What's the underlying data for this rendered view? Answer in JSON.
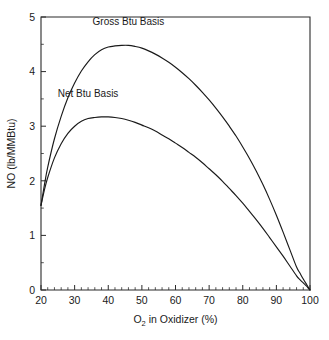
{
  "chart_data": {
    "type": "line",
    "title": "",
    "xlabel": "O2 in Oxidizer (%)",
    "xlabel_main": "O",
    "xlabel_sub": "2",
    "xlabel_rest": " in Oxidizer (%)",
    "ylabel": "NO (lb/MMBtu)",
    "xlim": [
      20,
      100
    ],
    "ylim": [
      0,
      5
    ],
    "x_ticks": [
      20,
      30,
      40,
      50,
      60,
      70,
      80,
      90,
      100
    ],
    "y_ticks": [
      0,
      1,
      2,
      3,
      4,
      5
    ],
    "x_minor_step": 2,
    "y_minor_step": 0.5,
    "grid": false,
    "legend_position": "inline-annotations",
    "series": [
      {
        "name": "Gross Btu Basis",
        "label_x": 46,
        "label_y": 4.85,
        "peak_x": 46,
        "peak_y": 4.48,
        "x": [
          20,
          21,
          22,
          24,
          26,
          28,
          30,
          32,
          34,
          36,
          38,
          40,
          42,
          44,
          46,
          48,
          50,
          52,
          54,
          56,
          58,
          60,
          62,
          64,
          66,
          68,
          70,
          72,
          74,
          76,
          78,
          80,
          82,
          84,
          86,
          88,
          90,
          92,
          94,
          96,
          97,
          98,
          99,
          99.5,
          100
        ],
        "y": [
          1.55,
          1.92,
          2.25,
          2.77,
          3.18,
          3.52,
          3.79,
          4.01,
          4.18,
          4.31,
          4.4,
          4.45,
          4.47,
          4.48,
          4.48,
          4.46,
          4.43,
          4.38,
          4.32,
          4.25,
          4.17,
          4.08,
          3.98,
          3.87,
          3.75,
          3.62,
          3.48,
          3.33,
          3.17,
          3.0,
          2.82,
          2.62,
          2.41,
          2.18,
          1.93,
          1.66,
          1.37,
          1.06,
          0.74,
          0.42,
          0.31,
          0.2,
          0.1,
          0.05,
          0.0
        ]
      },
      {
        "name": "Net Btu Basis",
        "label_x": 34,
        "label_y": 3.53,
        "peak_x": 41,
        "peak_y": 3.17,
        "x": [
          20,
          21,
          22,
          24,
          26,
          28,
          30,
          32,
          34,
          36,
          38,
          40,
          42,
          44,
          46,
          48,
          50,
          52,
          54,
          56,
          58,
          60,
          62,
          64,
          66,
          68,
          70,
          72,
          74,
          76,
          78,
          80,
          82,
          84,
          86,
          88,
          90,
          92,
          94,
          96,
          97,
          98,
          99,
          99.5,
          100
        ],
        "y": [
          1.55,
          1.83,
          2.06,
          2.42,
          2.68,
          2.87,
          3.0,
          3.09,
          3.14,
          3.16,
          3.17,
          3.17,
          3.16,
          3.14,
          3.11,
          3.07,
          3.02,
          2.97,
          2.91,
          2.84,
          2.77,
          2.69,
          2.61,
          2.52,
          2.43,
          2.33,
          2.22,
          2.11,
          1.99,
          1.86,
          1.73,
          1.59,
          1.44,
          1.29,
          1.13,
          0.96,
          0.79,
          0.62,
          0.44,
          0.26,
          0.19,
          0.13,
          0.07,
          0.03,
          0.0
        ]
      }
    ]
  },
  "colors": {
    "curve": "#1a1a1a",
    "axis": "#2b2b2b",
    "background": "#ffffff"
  }
}
